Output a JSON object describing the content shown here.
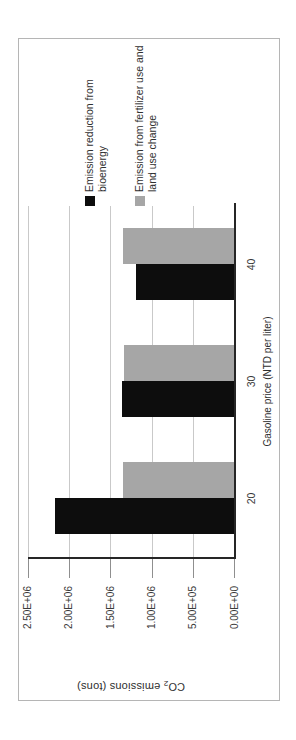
{
  "chart_data": {
    "type": "bar",
    "title": "",
    "xlabel": "Gasoline price (NTD per liter)",
    "ylabel": "CO₂ emissions (tons)",
    "ylabel_parts": {
      "prefix": "CO",
      "sub": "2",
      "suffix": " emissions (tons)"
    },
    "categories": [
      "20",
      "30",
      "40"
    ],
    "series": [
      {
        "name": "Emission reduction from bioenergy",
        "color": "#0d0d0d",
        "values": [
          2170000,
          1360000,
          1190000
        ]
      },
      {
        "name": "Emission from fertilizer use and land use change",
        "color": "#a6a6a6",
        "values": [
          1350000,
          1340000,
          1350000
        ]
      }
    ],
    "ylim": [
      0,
      2500000
    ],
    "y_ticks": [
      0,
      500000,
      1000000,
      1500000,
      2000000,
      2500000
    ],
    "y_tick_labels": [
      "2.50E+06",
      "2.00E+06",
      "1.50E+06",
      "1.00E+06",
      "5.00E+05",
      "0.00E+00"
    ],
    "grid": true,
    "legend_position": "right",
    "orientation_note": "landscape chart rotated 90deg CCW on portrait page"
  },
  "colors": {
    "series_black": "#0d0d0d",
    "series_gray": "#a6a6a6",
    "gridline": "#c9c9c9",
    "axis_line": "#262626",
    "chart_border": "#b5b5b5",
    "background": "#ffffff"
  }
}
